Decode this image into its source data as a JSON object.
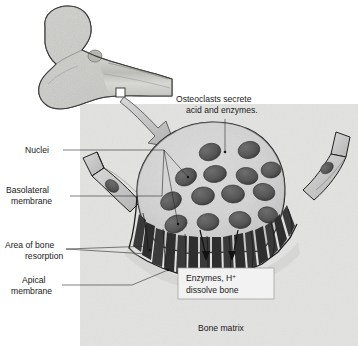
{
  "figure": {
    "style": "grayscale textbook illustration"
  },
  "inset": {
    "name": "femur-bone-inset",
    "description": "proximal femur with head, neck and greater trochanter",
    "marker": "white square region marker"
  },
  "annotations": {
    "osteoclast_callout_line1": "Osteoclasts secrete",
    "osteoclast_callout_line2": "acid and enzymes.",
    "nuclei": "Nuclei",
    "basolateral_line1": "Basolateral",
    "basolateral_line2": "membrane",
    "resorption_line1": "Area of bone",
    "resorption_line2": "resorption",
    "apical_line1": "Apical",
    "apical_line2": "membrane",
    "enzymes_box_line1a": "Enzymes, H",
    "enzymes_box_line1b": "+",
    "enzymes_box_line2": "dissolve bone",
    "bone_matrix": "Bone matrix"
  },
  "colors": {
    "bone_matrix_bg": "#e9e9e7",
    "cytoplasm": "#d6d6d6",
    "nucleus": "#585858",
    "outline": "#1f1f1f",
    "arrow_fill": "#c9c9c9",
    "lining_cell": "#c4c4c4",
    "callout_box": "#f2f2f2",
    "text": "#1a1a1a"
  },
  "structures": {
    "nuclei_count": 14,
    "ruffled_border": "finger-like apical projections",
    "lining_cells_left": 2,
    "lining_cells_right": 2,
    "dissolve_arrows": 2
  }
}
